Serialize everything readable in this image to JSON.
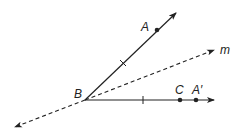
{
  "diagram": {
    "stroke_color": "#222222",
    "points": {
      "B": {
        "label": "B",
        "x": 85,
        "y": 100
      },
      "A": {
        "label": "A",
        "x": 157,
        "y": 30
      },
      "C": {
        "label": "C",
        "x": 180,
        "y": 100
      },
      "A_prime": {
        "label": "A′",
        "x": 196,
        "y": 100
      }
    },
    "lines": {
      "m": {
        "label": "m",
        "style": "dashed"
      }
    }
  }
}
